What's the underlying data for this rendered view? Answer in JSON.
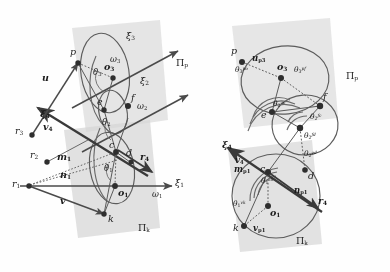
{
  "figure": {
    "kind": "technical-line-diagram",
    "background": "#fefefe",
    "line_color": "#4a4a4a",
    "plane_fill": "#d9d9d9",
    "point_color": "#3a3a3a"
  },
  "left_diagram": {
    "name": "left-kinematic-diagram",
    "axes": [
      {
        "id": "xi1",
        "label": "ξ",
        "sub": "1"
      },
      {
        "id": "xi2",
        "label": "ξ",
        "sub": "2"
      },
      {
        "id": "xi3",
        "label": "ξ",
        "sub": "3"
      },
      {
        "id": "xi4",
        "label": "ξ",
        "sub": "4"
      }
    ],
    "angular_velocities": [
      {
        "id": "omega1",
        "label": "ω",
        "sub": "1"
      },
      {
        "id": "omega2",
        "label": "ω",
        "sub": "2"
      },
      {
        "id": "omega3",
        "label": "ω",
        "sub": "3"
      }
    ],
    "points": [
      {
        "id": "p",
        "label": "p"
      },
      {
        "id": "e",
        "label": "e"
      },
      {
        "id": "f",
        "label": "f"
      },
      {
        "id": "c",
        "label": "c"
      },
      {
        "id": "d",
        "label": "d"
      },
      {
        "id": "k",
        "label": "k"
      },
      {
        "id": "o1",
        "label": "o",
        "sub": "1"
      },
      {
        "id": "o3",
        "label": "o",
        "sub": "3"
      },
      {
        "id": "r1",
        "label": "r",
        "sub": "1"
      },
      {
        "id": "r2",
        "label": "r",
        "sub": "2"
      },
      {
        "id": "r3",
        "label": "r",
        "sub": "3"
      },
      {
        "id": "r4",
        "label": "r",
        "sub": "4"
      }
    ],
    "vectors": [
      {
        "id": "u",
        "label": "u"
      },
      {
        "id": "v",
        "label": "v"
      },
      {
        "id": "v4",
        "label": "v",
        "sub": "4"
      },
      {
        "id": "m1",
        "label": "m",
        "sub": "1"
      },
      {
        "id": "n1",
        "label": "n",
        "sub": "1"
      }
    ],
    "angles": [
      {
        "id": "theta1",
        "label": "θ",
        "sub": "1"
      },
      {
        "id": "theta2",
        "label": "θ",
        "sub": "2"
      },
      {
        "id": "theta3",
        "label": "θ",
        "sub": "3"
      }
    ],
    "planes": [
      {
        "id": "pi-p",
        "label": "Π",
        "sub": "p"
      },
      {
        "id": "pi-k",
        "label": "Π",
        "sub": "k"
      }
    ]
  },
  "right_diagram": {
    "name": "right-kinematic-diagram",
    "axes": [
      {
        "id": "xi4",
        "label": "ξ",
        "sub": "4"
      }
    ],
    "points": [
      {
        "id": "p",
        "label": "p"
      },
      {
        "id": "e",
        "label": "e"
      },
      {
        "id": "f",
        "label": "f"
      },
      {
        "id": "c",
        "label": "c"
      },
      {
        "id": "d",
        "label": "d"
      },
      {
        "id": "k",
        "label": "k"
      },
      {
        "id": "o1",
        "label": "o",
        "sub": "1"
      },
      {
        "id": "o3",
        "label": "o",
        "sub": "3"
      },
      {
        "id": "r4",
        "label": "r",
        "sub": "4"
      }
    ],
    "vectors": [
      {
        "id": "up3",
        "label": "u",
        "sub": "p3"
      },
      {
        "id": "vp1",
        "label": "v",
        "sub": "p1"
      },
      {
        "id": "v4",
        "label": "v",
        "sub": "4"
      },
      {
        "id": "mp1",
        "label": "m",
        "sub": "p1"
      },
      {
        "id": "np1",
        "label": "n",
        "sub": "p1"
      }
    ],
    "angles": [
      {
        "id": "theta3-po",
        "label": "θ",
        "sub": "3",
        "sup": "po"
      },
      {
        "id": "theta3-pf",
        "label": "θ",
        "sub": "3",
        "sup": "pf"
      },
      {
        "id": "theta2-ec",
        "label": "θ",
        "sub": "2",
        "sup": "ec"
      },
      {
        "id": "theta2-fc",
        "label": "θ",
        "sub": "2",
        "sup": "fc"
      },
      {
        "id": "theta2-fd",
        "label": "θ",
        "sub": "2",
        "sup": "fd"
      },
      {
        "id": "theta2-ed",
        "label": "θ",
        "sub": "2",
        "sup": "ed"
      },
      {
        "id": "theta1-ck",
        "label": "θ",
        "sub": "1",
        "sup": "ck"
      },
      {
        "id": "theta1-vk",
        "label": "θ",
        "sub": "1",
        "sup": "vk"
      }
    ],
    "planes": [
      {
        "id": "pi-p",
        "label": "Π",
        "sub": "p"
      },
      {
        "id": "pi-k",
        "label": "Π",
        "sub": "k"
      }
    ]
  }
}
